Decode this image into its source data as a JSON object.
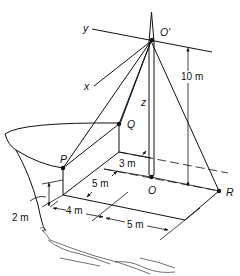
{
  "figure": {
    "type": "3D mechanics diagram — mast with guy cables on a boat deck",
    "points": {
      "O_prime": {
        "label": "O′"
      },
      "O": {
        "label": "O"
      },
      "P": {
        "label": "P"
      },
      "Q": {
        "label": "Q"
      },
      "R": {
        "label": "R"
      }
    },
    "axes": {
      "x": {
        "label": "x"
      },
      "y": {
        "label": "y"
      },
      "z": {
        "label": "z"
      }
    },
    "dimensions": {
      "mast_height": "10 m",
      "deck_depth": "3 m",
      "side_depth": "5 m",
      "deck_height": "2 m",
      "span_left": "4 m",
      "span_right": "5 m"
    }
  }
}
